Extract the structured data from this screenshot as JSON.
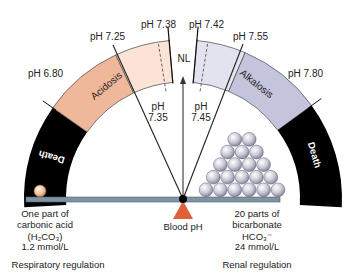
{
  "diagram": {
    "center": {
      "x": 183,
      "y": 199
    },
    "outer_radius": 159,
    "inner_radius": 117,
    "segments": [
      {
        "id": "death-left",
        "label": "Death",
        "from_ph": 6.5,
        "to_ph": 6.8,
        "color": "#000000",
        "text_color": "#ffffff"
      },
      {
        "id": "acidosis-severe",
        "label": "Acidosis",
        "from_ph": 6.8,
        "to_ph": 7.25,
        "color": "#f0b89a",
        "text_color": "#222222"
      },
      {
        "id": "acidosis-mild",
        "label": "",
        "from_ph": 7.25,
        "to_ph": 7.38,
        "color": "#fbe3d5",
        "text_color": "#222222"
      },
      {
        "id": "alkalosis-mild",
        "label": "",
        "from_ph": 7.42,
        "to_ph": 7.55,
        "color": "#e3e3f0",
        "text_color": "#222222"
      },
      {
        "id": "alkalosis-severe",
        "label": "Alkalosis",
        "from_ph": 7.55,
        "to_ph": 7.8,
        "color": "#c4c4dc",
        "text_color": "#222222"
      },
      {
        "id": "death-right",
        "label": "Death",
        "from_ph": 7.8,
        "to_ph": 8.1,
        "color": "#000000",
        "text_color": "#ffffff"
      }
    ],
    "markers": [
      {
        "ph": "pH 6.80",
        "angle": 145,
        "label_x": 28,
        "label_y": 77
      },
      {
        "ph": "pH 7.25",
        "angle": 115,
        "label_x": 90,
        "label_y": 40
      },
      {
        "ph": "pH 7.38",
        "angle": 95,
        "label_x": 141,
        "label_y": 28
      },
      {
        "ph": "pH 7.42",
        "angle": 85,
        "label_x": 189,
        "label_y": 28
      },
      {
        "ph": "pH 7.55",
        "angle": 67,
        "label_x": 233,
        "label_y": 40
      },
      {
        "ph": "pH 7.80",
        "angle": 36,
        "label_x": 288,
        "label_y": 77
      }
    ],
    "dashed_markers": [
      {
        "ph": "pH",
        "value": "7.35",
        "angle": 99,
        "label_x": 158,
        "label_y": 110
      },
      {
        "ph": "pH",
        "value": "7.45",
        "angle": 81,
        "label_x": 201,
        "label_y": 110
      }
    ],
    "normal_label": "NL",
    "pivot_label": "Blood pH",
    "left_side": {
      "lines": [
        "One part of",
        "carbonic acid",
        "(H₂CO₃)",
        "1.2 mmol/L"
      ],
      "regulation": "Respiratory regulation"
    },
    "right_side": {
      "lines": [
        "20 parts of",
        "bicarbonate",
        "HCO₃⁻",
        "24 mmol/L"
      ],
      "regulation": "Renal regulation"
    },
    "ball_rows": [
      6,
      5,
      4,
      3,
      2
    ],
    "colors": {
      "beam": "#7f93a3",
      "beam_edge": "#4f6272",
      "fulcrum": "#e0603a",
      "pivot": "#000000",
      "ball_light": "#ffffff",
      "ball_dark": "#8a8aa0",
      "acid_ball_light": "#fff1e6",
      "acid_ball_dark": "#d6865a",
      "text": "#222222"
    }
  }
}
